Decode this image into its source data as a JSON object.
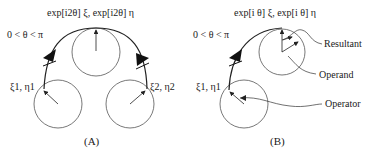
{
  "panel_a": {
    "caption": "(A)",
    "top_label": "exp[i2θ] ξ, exp[i2θ] η",
    "range_label": "0 < θ < π",
    "left_label": "ξ1, η1",
    "right_label": "ξ2, η2"
  },
  "panel_b": {
    "caption": "(B)",
    "top_label": "exp[i θ] ξ, exp[i θ] η",
    "range_label": "0 < θ < π",
    "left_label": "ξ1, η1",
    "callouts": {
      "resultant": "Resultant",
      "operand": "Operand",
      "operator": "Operator"
    }
  },
  "colors": {
    "stroke": "#222222",
    "circle": "#555555"
  }
}
